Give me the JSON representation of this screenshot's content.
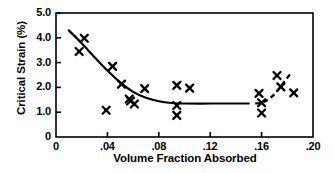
{
  "chart_data": {
    "type": "scatter",
    "title": "",
    "xlabel": "Volume Fraction Absorbed",
    "ylabel": "Critical Strain (%)",
    "xlim": [
      0,
      0.2
    ],
    "ylim": [
      0,
      5.0
    ],
    "grid": false,
    "legend": null,
    "xticks": [
      {
        "value": 0,
        "label": "0"
      },
      {
        "value": 0.04,
        "label": ".04"
      },
      {
        "value": 0.08,
        "label": ".08"
      },
      {
        "value": 0.12,
        "label": ".12"
      },
      {
        "value": 0.16,
        "label": ".16"
      },
      {
        "value": 0.2,
        "label": ".20"
      }
    ],
    "yticks": [
      {
        "value": 0,
        "label": "0"
      },
      {
        "value": 1.0,
        "label": "1.0"
      },
      {
        "value": 2.0,
        "label": "2.0"
      },
      {
        "value": 3.0,
        "label": "3.0"
      },
      {
        "value": 4.0,
        "label": "4.0"
      },
      {
        "value": 5.0,
        "label": "5.0"
      }
    ],
    "marker": "x-cross",
    "marker_color": "#000000",
    "points": [
      {
        "x": 0.018,
        "y": 3.45
      },
      {
        "x": 0.022,
        "y": 3.98
      },
      {
        "x": 0.039,
        "y": 1.08
      },
      {
        "x": 0.044,
        "y": 2.85
      },
      {
        "x": 0.051,
        "y": 2.13
      },
      {
        "x": 0.057,
        "y": 1.53
      },
      {
        "x": 0.058,
        "y": 1.45
      },
      {
        "x": 0.061,
        "y": 1.33
      },
      {
        "x": 0.069,
        "y": 1.95
      },
      {
        "x": 0.094,
        "y": 2.08
      },
      {
        "x": 0.094,
        "y": 1.27
      },
      {
        "x": 0.094,
        "y": 0.87
      },
      {
        "x": 0.104,
        "y": 1.97
      },
      {
        "x": 0.158,
        "y": 1.76
      },
      {
        "x": 0.16,
        "y": 1.38
      },
      {
        "x": 0.16,
        "y": 0.97
      },
      {
        "x": 0.172,
        "y": 2.48
      },
      {
        "x": 0.175,
        "y": 2.02
      },
      {
        "x": 0.185,
        "y": 1.78
      }
    ],
    "fit_curve_solid": {
      "style": "solid",
      "color": "#000000",
      "points": [
        {
          "x": 0.01,
          "y": 4.3
        },
        {
          "x": 0.02,
          "y": 3.78
        },
        {
          "x": 0.03,
          "y": 3.22
        },
        {
          "x": 0.04,
          "y": 2.68
        },
        {
          "x": 0.05,
          "y": 2.2
        },
        {
          "x": 0.06,
          "y": 1.82
        },
        {
          "x": 0.07,
          "y": 1.58
        },
        {
          "x": 0.08,
          "y": 1.44
        },
        {
          "x": 0.09,
          "y": 1.37
        },
        {
          "x": 0.1,
          "y": 1.35
        },
        {
          "x": 0.12,
          "y": 1.35
        },
        {
          "x": 0.14,
          "y": 1.35
        },
        {
          "x": 0.15,
          "y": 1.35
        }
      ]
    },
    "fit_curve_dashed": {
      "style": "dashed",
      "color": "#000000",
      "points": [
        {
          "x": 0.155,
          "y": 1.35
        },
        {
          "x": 0.162,
          "y": 1.42
        },
        {
          "x": 0.17,
          "y": 1.72
        },
        {
          "x": 0.176,
          "y": 2.12
        },
        {
          "x": 0.182,
          "y": 2.52
        }
      ]
    }
  },
  "axes": {
    "frame_color": "#000000",
    "ticks_direction": "inward"
  }
}
